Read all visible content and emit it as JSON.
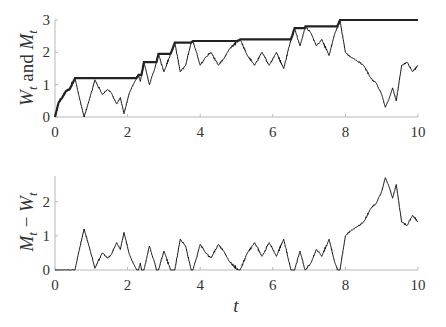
{
  "chart_data": [
    {
      "type": "line",
      "panel": "top",
      "title": "",
      "xlabel": "",
      "ylabel": "W_t and M_t",
      "ylabel_parts": [
        "W",
        "t",
        " and ",
        "M",
        "t"
      ],
      "xlim": [
        0,
        10
      ],
      "ylim": [
        0,
        3
      ],
      "xticks": [
        0,
        2,
        4,
        6,
        8,
        10
      ],
      "xtick_labels": [
        "0",
        "2",
        "4",
        "6",
        "8",
        "10"
      ],
      "yticks": [
        0,
        1,
        2,
        3
      ],
      "ytick_labels": [
        "0",
        "1",
        "2",
        "3"
      ],
      "grid": false,
      "legend": "none",
      "series": [
        {
          "name": "W_t (Brownian path, approximate keypoints)",
          "t": [
            0,
            0.1,
            0.2,
            0.3,
            0.4,
            0.55,
            0.65,
            0.8,
            0.95,
            1.1,
            1.3,
            1.45,
            1.55,
            1.7,
            1.8,
            1.9,
            2.05,
            2.2,
            2.3,
            2.35,
            2.45,
            2.6,
            2.75,
            2.85,
            3.0,
            3.2,
            3.3,
            3.45,
            3.6,
            3.75,
            3.8,
            4.0,
            4.15,
            4.3,
            4.5,
            4.65,
            4.8,
            5.1,
            5.3,
            5.5,
            5.7,
            5.9,
            6.1,
            6.3,
            6.5,
            6.6,
            6.75,
            6.9,
            7.05,
            7.2,
            7.35,
            7.55,
            7.7,
            7.85,
            8.0,
            8.15,
            8.3,
            8.5,
            8.7,
            8.85,
            9.0,
            9.1,
            9.2,
            9.3,
            9.4,
            9.55,
            9.7,
            9.85,
            10.0
          ],
          "values": [
            0,
            0.45,
            0.6,
            0.8,
            0.85,
            1.2,
            0.7,
            0.0,
            0.55,
            1.15,
            0.7,
            0.85,
            0.75,
            0.4,
            0.6,
            0.1,
            0.75,
            1.1,
            1.3,
            1.1,
            1.7,
            1.0,
            1.5,
            1.95,
            1.4,
            2.0,
            2.3,
            1.4,
            1.6,
            2.3,
            2.35,
            1.6,
            1.85,
            2.0,
            1.6,
            1.8,
            2.1,
            2.4,
            1.9,
            1.6,
            2.0,
            1.6,
            2.0,
            1.5,
            2.4,
            2.75,
            2.2,
            2.8,
            2.6,
            2.2,
            2.4,
            1.9,
            2.55,
            3.0,
            2.0,
            1.85,
            1.75,
            1.6,
            1.2,
            1.05,
            0.7,
            0.3,
            0.55,
            0.9,
            0.5,
            1.6,
            1.7,
            1.4,
            1.6
          ]
        },
        {
          "name": "M_t (running maximum of W_t)",
          "derived_from": "W_t"
        }
      ]
    },
    {
      "type": "line",
      "panel": "bottom",
      "title": "",
      "xlabel": "t",
      "ylabel": "M_t - W_t",
      "ylabel_parts": [
        "M",
        "t",
        " − ",
        "W",
        "t"
      ],
      "xlim": [
        0,
        10
      ],
      "ylim": [
        0,
        2.75
      ],
      "xticks": [
        0,
        2,
        4,
        6,
        8,
        10
      ],
      "xtick_labels": [
        "0",
        "2",
        "4",
        "6",
        "8",
        "10"
      ],
      "yticks": [
        0,
        1,
        2
      ],
      "ytick_labels": [
        "0",
        "1",
        "2"
      ],
      "grid": false,
      "legend": "none",
      "series": [
        {
          "name": "M_t - W_t",
          "derived_from": "M_t - W_t"
        }
      ]
    }
  ]
}
